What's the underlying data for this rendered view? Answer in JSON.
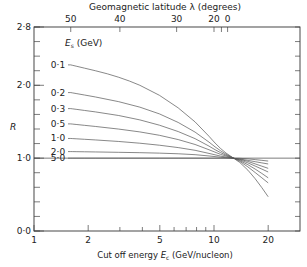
{
  "chart_data": {
    "type": "line",
    "title": "",
    "top_axis_label": "Geomagnetic latitude λ (degrees)",
    "top_ticks": [
      {
        "label": "50",
        "x": 1.6
      },
      {
        "label": "40",
        "x": 3.0
      },
      {
        "label": "30",
        "x": 6.2
      },
      {
        "label": "20",
        "x": 10.0
      },
      {
        "label": "0",
        "x": 11.9
      }
    ],
    "top_extra_tick_x": [
      11.0
    ],
    "xlabel": "Cut off energy E_c (GeV/nucleon)",
    "ylabel": "R",
    "xscale": "log",
    "xlim": [
      1,
      30
    ],
    "ylim": [
      0,
      2.8
    ],
    "x_ticks": [
      1,
      2,
      5,
      10,
      20
    ],
    "x_minor_ticks": [
      3,
      4,
      6,
      7,
      8,
      9
    ],
    "y_ticks": [
      "0·0",
      "1·0",
      "2·0",
      "2·8"
    ],
    "y_tick_values": [
      0,
      1.0,
      2.0,
      2.8
    ],
    "y_minor_step": 0.2,
    "reference_line_y": 1.0,
    "legend_title": "E_s (GeV)",
    "x": [
      1.6,
      3,
      5,
      8,
      11,
      14,
      17,
      20
    ],
    "series": [
      {
        "name": "0·1",
        "values": [
          2.28,
          2.12,
          1.88,
          1.5,
          1.1,
          0.95,
          0.72,
          0.47
        ]
      },
      {
        "name": "0·2",
        "values": [
          1.9,
          1.78,
          1.62,
          1.36,
          1.08,
          0.96,
          0.8,
          0.66
        ]
      },
      {
        "name": "0·3",
        "values": [
          1.68,
          1.59,
          1.46,
          1.27,
          1.06,
          0.97,
          0.85,
          0.73
        ]
      },
      {
        "name": "0·5",
        "values": [
          1.47,
          1.4,
          1.32,
          1.19,
          1.04,
          0.98,
          0.89,
          0.81
        ]
      },
      {
        "name": "1·0",
        "values": [
          1.27,
          1.23,
          1.18,
          1.11,
          1.02,
          0.99,
          0.92,
          0.86
        ]
      },
      {
        "name": "2·0",
        "values": [
          1.09,
          1.08,
          1.07,
          1.05,
          1.01,
          0.99,
          0.95,
          0.92
        ]
      },
      {
        "name": "5·0",
        "values": [
          1.0,
          1.0,
          1.0,
          1.0,
          1.0,
          1.0,
          0.98,
          0.96
        ]
      }
    ]
  }
}
